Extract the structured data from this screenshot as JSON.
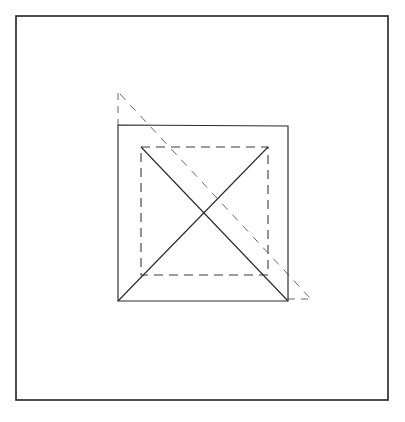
{
  "page": {
    "background_color": "#ffffff",
    "width": 405,
    "height": 422
  },
  "frame": {
    "name": "outer-border",
    "x": 16,
    "y": 16,
    "width": 372,
    "height": 384,
    "stroke_color": "#222222",
    "stroke_width": 1.6,
    "style": "solid"
  },
  "chart_data": {
    "type": "diagram",
    "title": "",
    "subtitle": "",
    "xlabel": "",
    "ylabel": "",
    "grid": false,
    "legend": "none",
    "shapes": [
      {
        "name": "solid-square",
        "kind": "square",
        "style": "solid",
        "stroke_color": "#2b2b2b",
        "corners": [
          [
            118,
            125
          ],
          [
            288,
            126
          ],
          [
            288,
            301
          ],
          [
            118,
            301
          ]
        ],
        "side_length": 170
      },
      {
        "name": "solid-diagonal-tl-br",
        "kind": "line",
        "style": "solid",
        "stroke_color": "#2b2b2b",
        "from": [
          141,
          147
        ],
        "to": [
          288,
          301
        ]
      },
      {
        "name": "solid-diagonal-bl-tr",
        "kind": "line",
        "style": "solid",
        "stroke_color": "#2b2b2b",
        "from": [
          118,
          301
        ],
        "to": [
          268,
          147
        ]
      },
      {
        "name": "dashed-square",
        "kind": "square",
        "style": "dashed",
        "stroke_color": "#3a3a3a",
        "corners": [
          [
            141,
            147
          ],
          [
            268,
            147
          ],
          [
            268,
            275
          ],
          [
            141,
            275
          ]
        ],
        "side_length": 127
      },
      {
        "name": "dashed-diagonal-extended",
        "kind": "line",
        "style": "dashed",
        "stroke_color": "#6a6a6a",
        "from": [
          120,
          94
        ],
        "to": [
          310,
          298
        ]
      },
      {
        "name": "dashed-vertical-stub-upper-left",
        "kind": "line",
        "style": "dashed",
        "stroke_color": "#6a6a6a",
        "from": [
          118,
          93
        ],
        "to": [
          118,
          125
        ]
      },
      {
        "name": "dashed-horizontal-stub-lower-right",
        "kind": "line",
        "style": "dashed",
        "stroke_color": "#6a6a6a",
        "from": [
          288,
          299
        ],
        "to": [
          312,
          299
        ]
      }
    ]
  }
}
